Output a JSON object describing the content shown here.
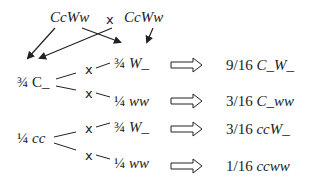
{
  "parents": {
    "left": "CcWw",
    "cross_symbol": "x",
    "right": "CcWw"
  },
  "branches": {
    "c_dominant": {
      "fraction": "¾",
      "genotype": "C_"
    },
    "c_recessive": {
      "fraction": "¼",
      "genotype": "cc"
    }
  },
  "sub_branches": [
    {
      "cross_symbol": "x",
      "fraction": "¾",
      "genotype": "W_"
    },
    {
      "cross_symbol": "x",
      "fraction": "¼",
      "genotype": "ww"
    },
    {
      "cross_symbol": "x",
      "fraction": "¾",
      "genotype": "W_"
    },
    {
      "cross_symbol": "x",
      "fraction": "¼",
      "genotype": "ww"
    }
  ],
  "results": [
    {
      "ratio": "9/16",
      "genotype": "C_W_"
    },
    {
      "ratio": "3/16",
      "genotype": "C_ww"
    },
    {
      "ratio": "3/16",
      "genotype": "ccW_"
    },
    {
      "ratio": "1/16",
      "genotype": "ccww"
    }
  ],
  "colors": {
    "ink": "#222222",
    "background": "#ffffff"
  }
}
